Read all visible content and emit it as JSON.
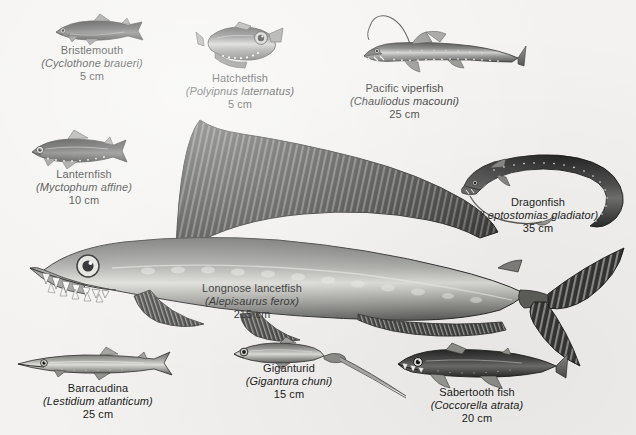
{
  "figure": {
    "background_color": "#f3f2f0",
    "text_color": "#1b1b1b",
    "specimens": [
      {
        "id": "bristlemouth",
        "common_name": "Bristlemouth",
        "scientific_name": "(Cyclothone braueri)",
        "size": "5 cm"
      },
      {
        "id": "hatchetfish",
        "common_name": "Hatchetfish",
        "scientific_name": "(Polyipnus laternatus)",
        "size": "5 cm"
      },
      {
        "id": "pacific-viperfish",
        "common_name": "Pacific viperfish",
        "scientific_name": "(Chauliodus macouni)",
        "size": "25 cm"
      },
      {
        "id": "lanternfish",
        "common_name": "Lanternfish",
        "scientific_name": "(Myctophum affine)",
        "size": "10 cm"
      },
      {
        "id": "dragonfish",
        "common_name": "Dragonfish",
        "scientific_name": "(Leptostomias gladiator)",
        "size": "35 cm"
      },
      {
        "id": "longnose-lancetfish",
        "common_name": "Longnose lancetfish",
        "scientific_name": "(Alepisaurus ferox)",
        "size": "215 cm"
      },
      {
        "id": "barracudina",
        "common_name": "Barracudina",
        "scientific_name": "(Lestidium atlanticum)",
        "size": "25 cm"
      },
      {
        "id": "giganturid",
        "common_name": "Giganturid",
        "scientific_name": "(Gigantura chuni)",
        "size": "15 cm"
      },
      {
        "id": "sabertooth-fish",
        "common_name": "Sabertooth fish",
        "scientific_name": "(Coccorella atrata)",
        "size": "20 cm"
      }
    ]
  }
}
